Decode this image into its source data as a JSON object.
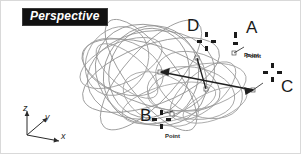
{
  "viewport": {
    "label": "Perspective",
    "background_color": "#ffffff",
    "border_color": "#d9d9d9",
    "width": 301,
    "height": 154
  },
  "plate": {
    "background_color": "#111111",
    "text_color": "#ffffff"
  },
  "geometry": {
    "wire_color": "#8a8a8a",
    "accent_color": "#1a1a1a",
    "description": "wireframe of overlapping ellipses"
  },
  "points": [
    {
      "id": "D",
      "letter": "D",
      "caption": "",
      "letter_x": 186,
      "letter_y": 16,
      "marker_x": 196,
      "marker_y": 31,
      "caption_x": 0,
      "caption_y": 0
    },
    {
      "id": "A",
      "letter": "A",
      "caption": "Point",
      "letter_x": 245,
      "letter_y": 18,
      "marker_x": 234,
      "marker_y": 35,
      "caption_x": 243,
      "caption_y": 53
    },
    {
      "id": "B",
      "letter": "B",
      "caption": "Point",
      "letter_x": 139,
      "letter_y": 108,
      "marker_x": 152,
      "marker_y": 111,
      "caption_x": 166,
      "caption_y": 133
    },
    {
      "id": "C",
      "letter": "C",
      "caption": "Point",
      "letter_x": 281,
      "letter_y": 79,
      "marker_x": 263,
      "marker_y": 66,
      "caption_x": 245,
      "caption_y": 54
    }
  ],
  "axis_triad": {
    "origin_x": 26,
    "origin_y": 134,
    "axes": [
      {
        "name": "z",
        "label": "z",
        "label_x": 22,
        "label_y": 104
      },
      {
        "name": "y",
        "label": "y",
        "label_x": 40,
        "label_y": 113
      },
      {
        "name": "x",
        "label": "x",
        "label_x": 62,
        "label_y": 132
      }
    ]
  }
}
